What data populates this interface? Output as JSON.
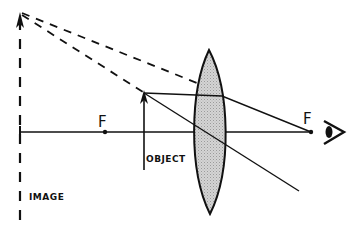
{
  "diagram": {
    "labels": {
      "focal_left": "F",
      "focal_right": "F",
      "object": "OBJECT",
      "image": "IMAGE"
    },
    "elements": {
      "lens": "convex (converging) lens, shaded",
      "object": "upright arrow between F and lens",
      "image": "virtual, upright, enlarged dashed arrow",
      "eye": "eye-icon viewing from right"
    },
    "colors": {
      "ink": "#111111",
      "lens_fill": "#c8c8c8",
      "background": "#ffffff"
    }
  }
}
